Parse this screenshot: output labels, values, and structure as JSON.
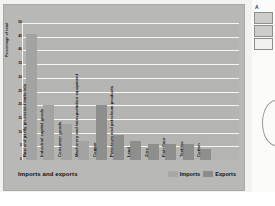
{
  "figure": {
    "caption_title": "Imports and exports",
    "y_axis_title": "Percentage of total"
  },
  "legend": {
    "imports_label": "Imports",
    "exports_label": "Exports"
  },
  "sidebar": {
    "letter": "A",
    "swatch_1_name": "swatch-filled-dark",
    "swatch_2_name": "swatch-filled-mid",
    "swatch_3_name": "swatch-empty",
    "arc_name": "partial-circle-shape"
  },
  "colors": {
    "imports": "#a3a3a1",
    "exports": "#8e8e8c",
    "plot_bg": "#b4b4b2",
    "gridline": "#f6f6f4",
    "card_bg": "#b8b8b6"
  },
  "chart_data": {
    "type": "bar",
    "title": "Imports and exports",
    "xlabel": "",
    "ylabel": "Percentage of total",
    "ylim": [
      0,
      50
    ],
    "yticks": [
      0,
      5,
      10,
      15,
      20,
      25,
      30,
      35,
      40,
      45,
      50
    ],
    "grid": true,
    "legend_position": "bottom-right",
    "categories": [
      "Raw and partly processed materials",
      "Industrial capital goods",
      "Consumer goods",
      "Machinery and transportation equipment",
      "Copper",
      "Petroleum and petroleum products",
      "Lead",
      "Zinc",
      "Fish flour",
      "Textiles",
      "Cotton"
    ],
    "series": [
      {
        "name": "Imports",
        "values": [
          46,
          20,
          13,
          7,
          null,
          null,
          null,
          null,
          null,
          null,
          null
        ]
      },
      {
        "name": "Exports",
        "values": [
          null,
          null,
          null,
          null,
          null,
          20,
          9,
          7,
          6,
          6,
          4
        ]
      }
    ],
    "bars": [
      {
        "label": "Raw and partly processed materials",
        "value": 46,
        "series": "Imports"
      },
      {
        "label": "Industrial capital goods",
        "value": 20,
        "series": "Imports"
      },
      {
        "label": "Consumer goods",
        "value": 13,
        "series": "Imports"
      },
      {
        "label": "Machinery and transportation equipment",
        "value": 7,
        "series": "Imports"
      },
      {
        "label": "Copper",
        "value": 20,
        "series": "Exports"
      },
      {
        "label": "Petroleum and petroleum products",
        "value": 9,
        "series": "Exports"
      },
      {
        "label": "Lead",
        "value": 7,
        "series": "Exports"
      },
      {
        "label": "Zinc",
        "value": 6,
        "series": "Exports"
      },
      {
        "label": "Fish flour",
        "value": 6,
        "series": "Exports"
      },
      {
        "label": "Textiles",
        "value": 6,
        "series": "Exports"
      },
      {
        "label": "Cotton",
        "value": 4,
        "series": "Exports"
      }
    ]
  }
}
